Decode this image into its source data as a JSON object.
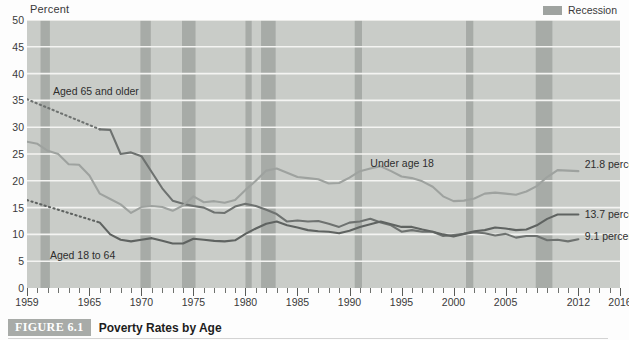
{
  "figure": {
    "badge": "FIGURE 6.1",
    "title": "Poverty Rates by Age"
  },
  "legend": {
    "recession_label": "Recession",
    "recession_color": "#9fa3a0"
  },
  "chart_data": {
    "type": "line",
    "title": "Poverty Rates by Age",
    "xlabel": "",
    "ylabel": "Percent",
    "ylim": [
      0,
      50
    ],
    "xlim": [
      1959,
      2016
    ],
    "grid": true,
    "legend_position": "top-right",
    "yticks": [
      0,
      5,
      10,
      15,
      20,
      25,
      30,
      35,
      40,
      45,
      50
    ],
    "xticks": [
      1959,
      1965,
      1970,
      1975,
      1980,
      1985,
      1990,
      1995,
      2000,
      2005,
      2012,
      2016
    ],
    "plot_background": "#c9ccc8",
    "gridline_color": "#f4f4f2",
    "annotations": [
      {
        "text": "Aged 65 and older",
        "x": 1961.5,
        "y": 36.5
      },
      {
        "text": "Under age 18",
        "x": 1992.0,
        "y": 23.2
      },
      {
        "text": "21.8 percent",
        "x": 2012.6,
        "y": 23.0
      },
      {
        "text": "13.7 percent",
        "x": 2012.6,
        "y": 13.6
      },
      {
        "text": "9.1 percent",
        "x": 2012.6,
        "y": 9.6
      },
      {
        "text": "Aged 18 to 64",
        "x": 1961.2,
        "y": 6.0
      }
    ],
    "recessions": [
      {
        "start": 1960.3,
        "end": 1961.2
      },
      {
        "start": 1969.9,
        "end": 1970.9
      },
      {
        "start": 1973.9,
        "end": 1975.2
      },
      {
        "start": 1980.0,
        "end": 1980.6
      },
      {
        "start": 1981.5,
        "end": 1982.9
      },
      {
        "start": 1990.5,
        "end": 1991.2
      },
      {
        "start": 2001.2,
        "end": 2001.9
      },
      {
        "start": 2007.9,
        "end": 2009.5
      }
    ],
    "x": [
      1959,
      1960,
      1961,
      1962,
      1963,
      1964,
      1965,
      1966,
      1967,
      1968,
      1969,
      1970,
      1971,
      1972,
      1973,
      1974,
      1975,
      1976,
      1977,
      1978,
      1979,
      1980,
      1981,
      1982,
      1983,
      1984,
      1985,
      1986,
      1987,
      1988,
      1989,
      1990,
      1991,
      1992,
      1993,
      1994,
      1995,
      1996,
      1997,
      1998,
      1999,
      2000,
      2001,
      2002,
      2003,
      2004,
      2005,
      2006,
      2007,
      2008,
      2009,
      2010,
      2011,
      2012
    ],
    "series": [
      {
        "name": "Aged 65 and older",
        "color": "#6e7270",
        "dashed_range": [
          1959,
          1966
        ],
        "end_value": 9.1,
        "end_label": "9.1 percent",
        "values": [
          35.2,
          34.4,
          33.6,
          32.8,
          32.0,
          31.2,
          30.4,
          29.6,
          29.5,
          25.0,
          25.3,
          24.6,
          21.6,
          18.6,
          16.3,
          15.7,
          15.3,
          15.0,
          14.1,
          14.0,
          15.2,
          15.7,
          15.3,
          14.6,
          13.8,
          12.4,
          12.6,
          12.4,
          12.5,
          12.0,
          11.4,
          12.2,
          12.4,
          12.9,
          12.2,
          11.7,
          10.5,
          10.8,
          10.5,
          10.5,
          9.7,
          9.9,
          10.1,
          10.4,
          10.2,
          9.8,
          10.1,
          9.4,
          9.7,
          9.7,
          8.9,
          9.0,
          8.7,
          9.1
        ]
      },
      {
        "name": "Under age 18",
        "color": "#9ea29f",
        "end_value": 21.8,
        "end_label": "21.8 percent",
        "values": [
          27.3,
          26.9,
          25.6,
          25.0,
          23.1,
          23.0,
          21.0,
          17.6,
          16.6,
          15.6,
          14.0,
          15.1,
          15.3,
          15.1,
          14.4,
          15.4,
          17.1,
          16.0,
          16.2,
          15.9,
          16.4,
          18.3,
          20.0,
          21.9,
          22.3,
          21.5,
          20.7,
          20.5,
          20.3,
          19.5,
          19.6,
          20.6,
          21.8,
          22.3,
          22.7,
          21.8,
          20.8,
          20.5,
          19.9,
          18.9,
          17.1,
          16.2,
          16.3,
          16.7,
          17.6,
          17.8,
          17.6,
          17.4,
          18.0,
          19.0,
          20.7,
          22.0,
          21.9,
          21.8
        ]
      },
      {
        "name": "Aged 18 to 64",
        "color": "#5f6361",
        "dashed_range": [
          1959,
          1966
        ],
        "end_value": 13.7,
        "end_label": "13.7 percent",
        "values": [
          16.4,
          15.8,
          15.2,
          14.6,
          14.0,
          13.4,
          12.8,
          12.2,
          10.0,
          9.0,
          8.7,
          9.0,
          9.3,
          8.8,
          8.3,
          8.3,
          9.2,
          9.0,
          8.8,
          8.7,
          8.9,
          10.1,
          11.1,
          12.0,
          12.4,
          11.7,
          11.3,
          10.8,
          10.6,
          10.5,
          10.2,
          10.7,
          11.4,
          11.9,
          12.4,
          11.9,
          11.4,
          11.4,
          10.9,
          10.5,
          10.0,
          9.6,
          10.1,
          10.6,
          10.8,
          11.3,
          11.1,
          10.8,
          10.9,
          11.7,
          12.9,
          13.7,
          13.7,
          13.7
        ]
      }
    ]
  }
}
